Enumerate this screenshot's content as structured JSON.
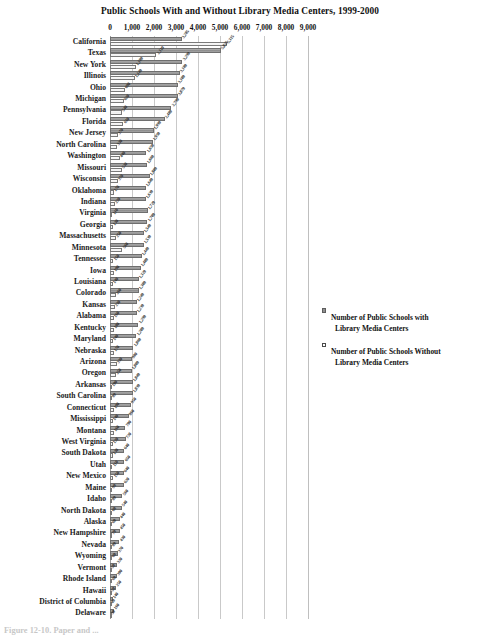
{
  "chart_data": {
    "type": "bar",
    "orientation": "horizontal",
    "title": "Public Schools With and Without Library Media Centers, 1999-2000",
    "xlabel": "",
    "ylabel": "",
    "xlim": [
      0,
      9000
    ],
    "xticks": [
      0,
      1000,
      2000,
      3000,
      4000,
      5000,
      6000,
      7000,
      8000,
      9000
    ],
    "xtick_labels": [
      "0",
      "1,000",
      "2,000",
      "3,000",
      "4,000",
      "5,000",
      "6,000",
      "7,000",
      "8,000",
      "9,000"
    ],
    "grid": true,
    "legend_position": "right",
    "categories": [
      "California",
      "Texas",
      "New York",
      "Illinois",
      "Ohio",
      "Michigan",
      "Pennsylvania",
      "Florida",
      "New Jersey",
      "North Carolina",
      "Washington",
      "Missouri",
      "Wisconsin",
      "Oklahoma",
      "Indiana",
      "Virginia",
      "Georgia",
      "Massachusetts",
      "Minnesota",
      "Tennessee",
      "Iowa",
      "Louisiana",
      "Colorado",
      "Kansas",
      "Alabama",
      "Kentucky",
      "Maryland",
      "Nebraska",
      "Arizona",
      "Oregon",
      "Arkansas",
      "South Carolina",
      "Connecticut",
      "Mississippi",
      "Montana",
      "West Virginia",
      "South Dakota",
      "Utah",
      "New Mexico",
      "Maine",
      "Idaho",
      "North Dakota",
      "Alaska",
      "New Hampshire",
      "Nevada",
      "Wyoming",
      "Vermont",
      "Rhode Island",
      "Hawaii",
      "District of Columbia",
      "Delaware"
    ],
    "series": [
      {
        "name": "Number of Public Schools with Library Media Centers",
        "key": "with",
        "values": [
          3285,
          5025,
          3290,
          3180,
          3100,
          3070,
          2790,
          2480,
          1990,
          1950,
          1650,
          1660,
          1800,
          1640,
          1630,
          1720,
          1700,
          1540,
          1530,
          1440,
          1400,
          1320,
          1300,
          1240,
          1230,
          1290,
          1200,
          1060,
          980,
          1000,
          1040,
          1030,
          950,
          860,
          700,
          720,
          640,
          650,
          640,
          620,
          560,
          540,
          440,
          450,
          430,
          370,
          320,
          300,
          250,
          140,
          160
        ]
      },
      {
        "name": "Number of Public Schools Without Library Media Centers",
        "key": "without",
        "values": [
          5315,
          2110,
          1180,
          1140,
          690,
          620,
          540,
          610,
          370,
          330,
          440,
          530,
          370,
          170,
          220,
          110,
          130,
          250,
          560,
          150,
          190,
          140,
          260,
          230,
          160,
          180,
          140,
          170,
          330,
          250,
          100,
          80,
          190,
          140,
          160,
          120,
          130,
          110,
          150,
          90,
          80,
          60,
          60,
          70,
          80,
          60,
          50,
          60,
          50,
          40,
          30
        ]
      }
    ]
  },
  "legend": {
    "items": [
      {
        "swatch": "filled",
        "line1": "Number of Public Schools with",
        "line2": "Library Media Centers"
      },
      {
        "swatch": "hollow",
        "line1": "Number of Public Schools Without",
        "line2": "Library Media Centers"
      }
    ]
  },
  "caption": "Figure 12-10.   Paper and ..."
}
